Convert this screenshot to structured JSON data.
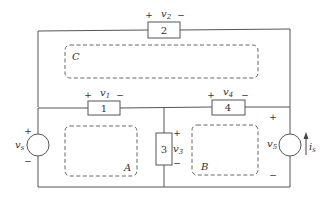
{
  "diagram": {
    "type": "circuit",
    "elements": [
      {
        "id": "1",
        "label": "1",
        "voltage": "v",
        "voltage_sub": "1",
        "plus": "+",
        "minus": "−"
      },
      {
        "id": "2",
        "label": "2",
        "voltage": "v",
        "voltage_sub": "2",
        "plus": "+",
        "minus": "−"
      },
      {
        "id": "3",
        "label": "3",
        "voltage": "v",
        "voltage_sub": "3",
        "plus": "+",
        "minus": "−"
      },
      {
        "id": "4",
        "label": "4",
        "voltage": "v",
        "voltage_sub": "4",
        "plus": "+",
        "minus": "−"
      }
    ],
    "sources": {
      "vs": {
        "voltage": "v",
        "voltage_sub": "s",
        "plus": "+",
        "minus": "−"
      },
      "v5": {
        "voltage": "v",
        "voltage_sub": "5",
        "current": "i",
        "current_sub": "s",
        "plus": "+",
        "minus": "−"
      }
    },
    "loops": {
      "A": "A",
      "B": "B",
      "C": "C"
    },
    "colors": {
      "wire": "#555555",
      "dash": "#666666",
      "text": "#333333"
    }
  }
}
